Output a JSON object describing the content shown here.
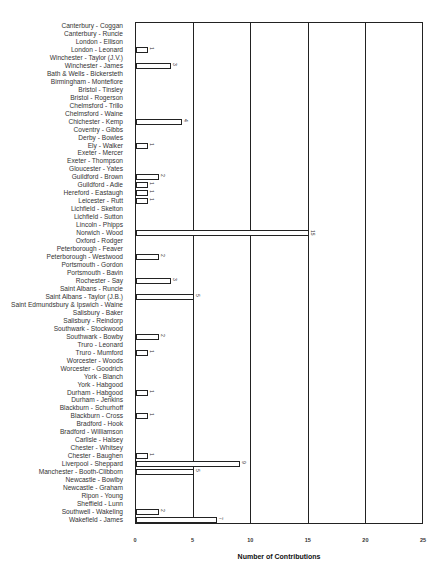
{
  "chart_data": {
    "type": "bar",
    "orientation": "horizontal",
    "title": "",
    "xlabel": "Number of Contributions",
    "ylabel": "",
    "xlim": [
      0,
      25
    ],
    "xticks": [
      0,
      5,
      10,
      15,
      20,
      25
    ],
    "grid": true,
    "legend": null,
    "categories": [
      "Canterbury - Coggan",
      "Canterbury - Runcie",
      "London - Ellison",
      "London - Leonard",
      "Winchester - Taylor (J.V.)",
      "Winchester - James",
      "Bath & Wells - Bickersteth",
      "Birmingham - Montefiore",
      "Bristol - Tinsley",
      "Bristol - Rogerson",
      "Chelmsford - Trillo",
      "Chelmsford - Waine",
      "Chichester - Kemp",
      "Coventry - Gibbs",
      "Derby - Bowles",
      "Ely - Walker",
      "Exeter - Mercer",
      "Exeter - Thompson",
      "Gloucester - Yates",
      "Guildford - Brown",
      "Guildford - Adie",
      "Hereford - Eastaugh",
      "Leicester - Rutt",
      "Lichfield - Skelton",
      "Lichfield - Sutton",
      "Lincoln - Phipps",
      "Norwich - Wood",
      "Oxford - Rodger",
      "Peterborough - Feaver",
      "Peterborough - Westwood",
      "Portsmouth - Gordon",
      "Portsmouth - Bavin",
      "Rochester - Say",
      "Saint Albans - Runcie",
      "Saint Albans - Taylor (J.B.)",
      "Saint Edmundsbury & Ipswich - Waine",
      "Salisbury - Baker",
      "Salisbury - Reindorp",
      "Southwark - Stockwood",
      "Southwark - Bowby",
      "Truro - Leonard",
      "Truro - Mumford",
      "Worcester - Woods",
      "Worcester - Goodrich",
      "York - Blanch",
      "York - Habgood",
      "Durham - Habgood",
      "Durham - Jenkins",
      "Blackburn - Schurhoff",
      "Blackburn - Cross",
      "Bradford - Hook",
      "Bradford - Williamson",
      "Carlisle - Halsey",
      "Chester - Whitsey",
      "Chester - Baughen",
      "Liverpool - Sheppard",
      "Manchester - Booth-Clibborn",
      "Newcastle - Bowlby",
      "Newcastle - Graham",
      "Ripon - Young",
      "Sheffield - Lunn",
      "Southwell - Wakeling",
      "Wakefield - James"
    ],
    "values": [
      0,
      0,
      0,
      1,
      0,
      3,
      0,
      0,
      0,
      0,
      0,
      0,
      4,
      0,
      0,
      1,
      0,
      0,
      0,
      2,
      1,
      1,
      1,
      0,
      0,
      0,
      15,
      0,
      0,
      2,
      0,
      0,
      3,
      0,
      5,
      0,
      0,
      0,
      0,
      2,
      0,
      1,
      0,
      0,
      0,
      0,
      1,
      0,
      0,
      1,
      0,
      0,
      0,
      0,
      1,
      9,
      5,
      0,
      0,
      0,
      0,
      2,
      7
    ],
    "series": [
      {
        "name": "Number of Contributions",
        "values": [
          0,
          0,
          0,
          1,
          0,
          3,
          0,
          0,
          0,
          0,
          0,
          0,
          4,
          0,
          0,
          1,
          0,
          0,
          0,
          2,
          1,
          1,
          1,
          0,
          0,
          0,
          15,
          0,
          0,
          2,
          0,
          0,
          3,
          0,
          5,
          0,
          0,
          0,
          0,
          2,
          0,
          1,
          0,
          0,
          0,
          0,
          1,
          0,
          0,
          1,
          0,
          0,
          0,
          0,
          1,
          9,
          5,
          0,
          0,
          0,
          0,
          2,
          7
        ]
      }
    ]
  }
}
